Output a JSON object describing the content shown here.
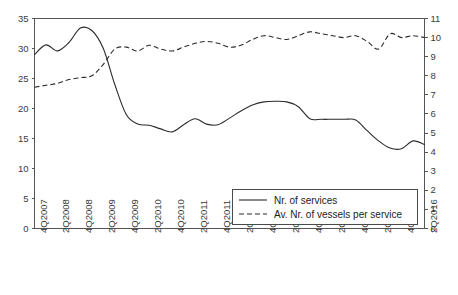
{
  "chart_data": {
    "type": "line",
    "title": "",
    "subtitle": "",
    "xlabel": "",
    "ylabel": "",
    "y2label": "",
    "grid": false,
    "legend_position": "inside-bottom-center",
    "categories": [
      "4Q2007",
      "2Q2008",
      "4Q2008",
      "2Q2009",
      "4Q2009",
      "2Q2010",
      "4Q2010",
      "2Q2011",
      "4Q2011",
      "2Q2012",
      "4Q2012",
      "2Q2013",
      "4Q2013",
      "2Q2014",
      "4Q2014",
      "2Q2015",
      "4Q2015",
      "2Q2016"
    ],
    "x_tick_labels": [
      "4Q2007",
      "2Q2008",
      "4Q2008",
      "2Q2009",
      "4Q2009",
      "2Q2010",
      "4Q2010",
      "2Q2011",
      "4Q2011",
      "2Q2012",
      "4Q2012",
      "2Q2013",
      "4Q2013",
      "2Q2014",
      "4Q2014",
      "2Q2015",
      "4Q2015",
      "2Q2016"
    ],
    "ylim": [
      0,
      35
    ],
    "y_ticks": [
      0,
      5,
      10,
      15,
      20,
      25,
      30,
      35
    ],
    "y2lim": [
      0,
      11
    ],
    "y2_ticks": [
      0,
      1,
      2,
      3,
      4,
      5,
      6,
      7,
      8,
      9,
      10,
      11
    ],
    "series": [
      {
        "name": "Nr. of services",
        "axis": "left",
        "style": "solid",
        "color": "#2b2b2b",
        "x": [
          "4Q2007",
          "1Q2008",
          "2Q2008",
          "3Q2008",
          "4Q2008",
          "1Q2009",
          "2Q2009",
          "3Q2009",
          "4Q2009",
          "1Q2010",
          "2Q2010",
          "3Q2010",
          "4Q2010",
          "1Q2011",
          "2Q2011",
          "3Q2011",
          "4Q2011",
          "1Q2012",
          "2Q2012",
          "3Q2012",
          "4Q2012",
          "1Q2013",
          "2Q2013",
          "3Q2013",
          "4Q2013",
          "1Q2014",
          "2Q2014",
          "3Q2014",
          "4Q2014",
          "1Q2015",
          "2Q2015",
          "3Q2015",
          "4Q2015",
          "1Q2016",
          "2Q2016"
        ],
        "values": [
          29.0,
          30.6,
          29.6,
          31.0,
          33.4,
          33.0,
          30.0,
          24.0,
          19.0,
          17.4,
          17.2,
          16.6,
          16.1,
          17.3,
          18.3,
          17.4,
          17.3,
          18.4,
          19.6,
          20.6,
          21.1,
          21.2,
          21.1,
          20.3,
          18.3,
          18.2,
          18.2,
          18.2,
          18.1,
          16.3,
          14.6,
          13.4,
          13.3,
          14.6,
          14.0
        ]
      },
      {
        "name": "Av. Nr. of vessels per service",
        "axis": "right",
        "style": "dashed",
        "color": "#2b2b2b",
        "x": [
          "4Q2007",
          "1Q2008",
          "2Q2008",
          "3Q2008",
          "4Q2008",
          "1Q2009",
          "2Q2009",
          "3Q2009",
          "4Q2009",
          "1Q2010",
          "2Q2010",
          "3Q2010",
          "4Q2010",
          "1Q2011",
          "2Q2011",
          "3Q2011",
          "4Q2011",
          "1Q2012",
          "2Q2012",
          "3Q2012",
          "4Q2012",
          "1Q2013",
          "2Q2013",
          "3Q2013",
          "4Q2013",
          "1Q2014",
          "2Q2014",
          "3Q2014",
          "4Q2014",
          "1Q2015",
          "2Q2015",
          "3Q2015",
          "4Q2015",
          "1Q2016",
          "2Q2016"
        ],
        "values": [
          7.4,
          7.5,
          7.6,
          7.8,
          7.9,
          8.0,
          8.6,
          9.4,
          9.5,
          9.3,
          9.6,
          9.4,
          9.3,
          9.5,
          9.7,
          9.8,
          9.7,
          9.5,
          9.6,
          9.9,
          10.1,
          10.0,
          9.9,
          10.1,
          10.3,
          10.2,
          10.1,
          10.0,
          10.1,
          9.8,
          9.4,
          10.2,
          10.0,
          10.1,
          10.0
        ]
      }
    ]
  },
  "legend": {
    "items": [
      {
        "label": "Nr. of services",
        "style": "solid"
      },
      {
        "label": "Av. Nr. of vessels per service",
        "style": "dashed"
      }
    ]
  }
}
